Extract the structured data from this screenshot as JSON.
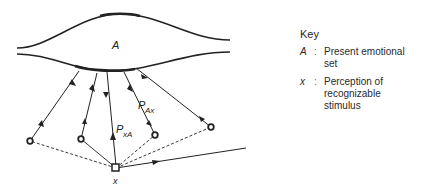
{
  "diagram": {
    "region_label": "A",
    "stimulus_label": "x",
    "path_labels": {
      "p_ax": {
        "main": "P",
        "sub": "Ax"
      },
      "p_xa": {
        "main": "P",
        "sub": "xA"
      }
    }
  },
  "key": {
    "title": "Key",
    "items": [
      {
        "symbol": "A",
        "separator": ":",
        "description": "Present emotional set"
      },
      {
        "symbol": "x",
        "separator": ":",
        "description": "Perception of recognizable stimulus"
      }
    ]
  }
}
